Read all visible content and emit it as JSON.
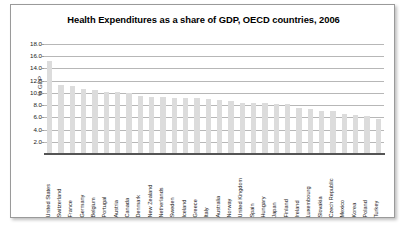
{
  "chart": {
    "title": "Health Expenditures as a share of GDP, OECD countries, 2006",
    "ylabel": "% GDP"
  },
  "chart_data": {
    "type": "bar",
    "title": "Health Expenditures as a share of GDP, OECD countries, 2006",
    "xlabel": "",
    "ylabel": "% GDP",
    "ylim": [
      0,
      18
    ],
    "ytick_labels": [
      "18.0",
      "16.0",
      "14.0",
      "12.0",
      "10.0",
      "8.0",
      "6.0",
      "4.0",
      "2.0"
    ],
    "ytick_values": [
      18,
      16,
      14,
      12,
      10,
      8,
      6,
      4,
      2
    ],
    "grid": true,
    "legend": "none",
    "bar_color": "#dcdcdc",
    "categories": [
      "United States",
      "Switzerland",
      "France",
      "Germany",
      "Belgium",
      "Portugal",
      "Austria",
      "Canada",
      "Denmark",
      "New Zealand",
      "Netherlands",
      "Sweden",
      "Iceland",
      "Greece",
      "Italy",
      "Australia",
      "Norway",
      "United Kingdom",
      "Spain",
      "Hungary",
      "Japan",
      "Finland",
      "Ireland",
      "Luxembourg",
      "Slovakia",
      "Czech Republic",
      "Mexico",
      "Korea",
      "Poland",
      "Turkey"
    ],
    "values": [
      15.3,
      11.3,
      11.1,
      10.6,
      10.4,
      10.2,
      10.1,
      10.0,
      9.5,
      9.4,
      9.3,
      9.2,
      9.1,
      9.1,
      9.0,
      8.8,
      8.7,
      8.4,
      8.4,
      8.3,
      8.2,
      8.2,
      7.6,
      7.3,
      7.1,
      7.0,
      6.6,
      6.4,
      6.2,
      5.8
    ]
  }
}
